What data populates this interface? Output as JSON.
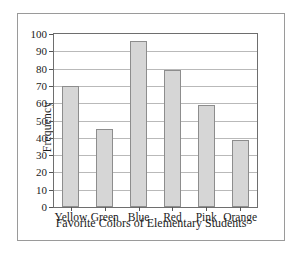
{
  "chart_data": {
    "type": "bar",
    "title": "",
    "xlabel": "Favorite Colors of Elementary Students",
    "ylabel": "Frequency",
    "categories": [
      "Yellow",
      "Green",
      "Blue",
      "Red",
      "Pink",
      "Orange"
    ],
    "values": [
      70,
      45,
      96,
      79,
      59,
      39
    ],
    "ylim": [
      0,
      100
    ],
    "ytick_step": 10,
    "yticks": [
      0,
      10,
      20,
      30,
      40,
      50,
      60,
      70,
      80,
      90,
      100
    ],
    "ytick_labels": [
      "0",
      "10",
      "20",
      "30",
      "40",
      "50",
      "60",
      "70",
      "80",
      "90",
      "100"
    ],
    "grid": "horizontal",
    "legend": "none",
    "bar_fill_color": "#d6d6d6",
    "bar_border_color": "#8d8d8d",
    "axis_color": "#6e6e6e",
    "gridline_color": "#b9b9b9",
    "frame_color": "#9a9a9a",
    "background_color": "#ffffff"
  }
}
